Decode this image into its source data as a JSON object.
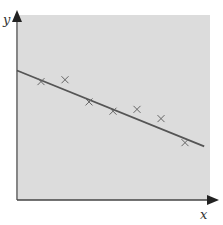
{
  "chart_data": {
    "type": "scatter",
    "title": "",
    "xlabel": "x",
    "ylabel": "y",
    "grid": false,
    "legend": null,
    "points": [
      {
        "x": 1,
        "y": 6.4
      },
      {
        "x": 2,
        "y": 6.5
      },
      {
        "x": 3,
        "y": 5.3
      },
      {
        "x": 4,
        "y": 4.8
      },
      {
        "x": 5,
        "y": 4.9
      },
      {
        "x": 6,
        "y": 4.4
      },
      {
        "x": 7,
        "y": 3.1
      }
    ],
    "trendline": {
      "type": "linear",
      "x0": 0,
      "y0": 7.0,
      "x1": 7.8,
      "y1": 2.9
    },
    "xlim": [
      0,
      8
    ],
    "ylim": [
      0,
      10
    ],
    "colors": {
      "plot_background": "#dcdcdc",
      "axis": "#444444",
      "marker": "#666666",
      "line": "#555555"
    }
  }
}
